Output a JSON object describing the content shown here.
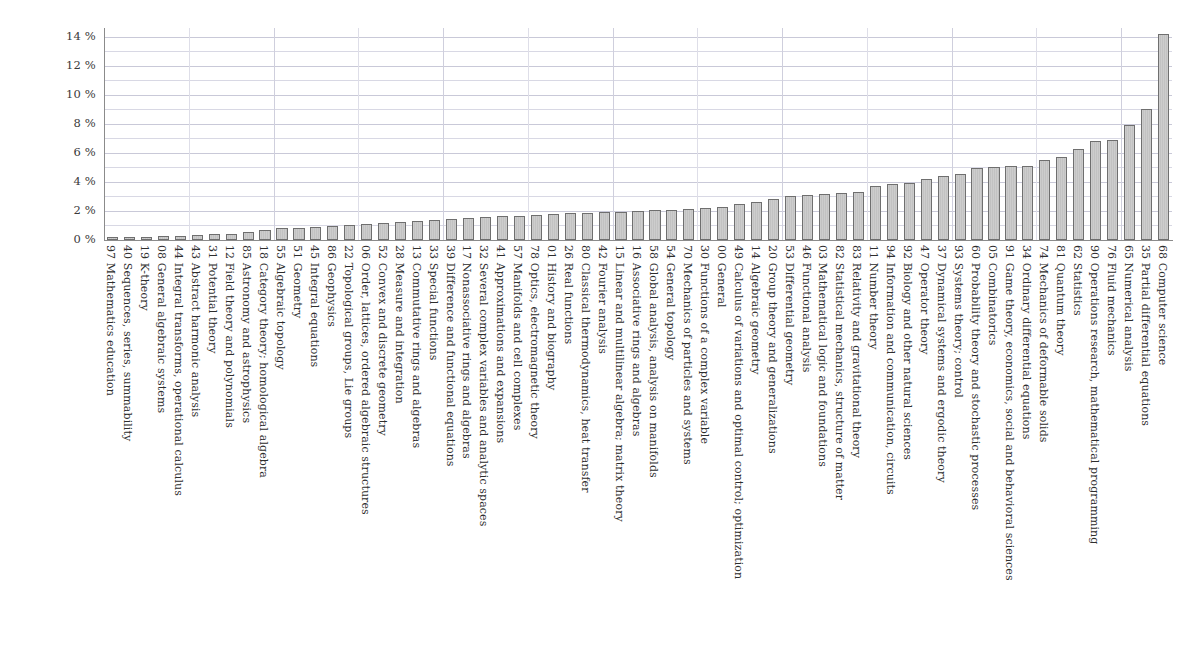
{
  "chart_data": {
    "type": "bar",
    "title": "",
    "subtitle": "",
    "xlabel": "",
    "ylabel": "",
    "ylim": [
      0,
      14.6
    ],
    "ytick_labels": [
      "0 %",
      "2 %",
      "4 %",
      "6 %",
      "8 %",
      "10 %",
      "12 %",
      "14 %"
    ],
    "ytick_values": [
      0,
      2,
      4,
      6,
      8,
      10,
      12,
      14
    ],
    "grid": true,
    "legend": "none",
    "value_unit": "%",
    "categories": [
      "97 Mathematics education",
      "40 Sequences, series, summability",
      "19 K-theory",
      "08 General algebraic systems",
      "44 Integral transforms, operational calculus",
      "43 Abstract harmonic analysis",
      "31 Potential theory",
      "12 Field theory and polynomials",
      "85 Astronomy and astrophysics",
      "18 Category theory; homological algebra",
      "55 Algebraic topology",
      "51 Geometry",
      "45 Integral equations",
      "86 Geophysics",
      "22 Topological groups, Lie groups",
      "06 Order, lattices, ordered algebraic structures",
      "52 Convex and discrete geometry",
      "28 Measure and integration",
      "13 Commutative rings and algebras",
      "33 Special functions",
      "39 Difference and functional equations",
      "17 Nonassociative rings and algebras",
      "32 Several complex variables and analytic spaces",
      "41 Approximations and expansions",
      "57 Manifolds and cell complexes",
      "78 Optics, electromagnetic theory",
      "01 History and biography",
      "26 Real functions",
      "80 Classical thermodynamics, heat transfer",
      "42 Fourier analysis",
      "15 Linear and multilinear algebra; matrix theory",
      "16 Associative rings and algebras",
      "58 Global analysis, analysis on manifolds",
      "54 General topology",
      "70 Mechanics of particles and systems",
      "30 Functions of a complex variable",
      "00 General",
      "49 Calculus of variations and optimal control; optimization",
      "14 Algebraic geometry",
      "20 Group theory and generalizations",
      "53 Differential geometry",
      "46 Functional analysis",
      "03 Mathematical logic and foundations",
      "82 Statistical mechanics, structure of matter",
      "83 Relativity and gravitational theory",
      "11 Number theory",
      "94 Information and communication, circuits",
      "92 Biology and other natural sciences",
      "47 Operator theory",
      "37 Dynamical systems and ergodic theory",
      "93 Systems theory; control",
      "60 Probability theory and stochastic processes",
      "05 Combinatorics",
      "91 Game theory, economics, social and behavioral sciences",
      "34 Ordinary differential equations",
      "74 Mechanics of deformable solids",
      "81 Quantum theory",
      "62 Statistics",
      "90 Operations research, mathematical programming",
      "76 Fluid mechanics",
      "65 Numerical analysis",
      "35 Partial differential equations",
      "68 Computer science"
    ],
    "values": [
      0.14,
      0.18,
      0.22,
      0.26,
      0.3,
      0.34,
      0.38,
      0.42,
      0.55,
      0.72,
      0.8,
      0.86,
      0.92,
      0.96,
      1.05,
      1.12,
      1.2,
      1.26,
      1.32,
      1.38,
      1.44,
      1.5,
      1.58,
      1.62,
      1.66,
      1.72,
      1.78,
      1.84,
      1.88,
      1.92,
      1.96,
      2.0,
      2.04,
      2.08,
      2.12,
      2.2,
      2.28,
      2.45,
      2.62,
      2.8,
      3.0,
      3.1,
      3.16,
      3.22,
      3.3,
      3.7,
      3.85,
      3.92,
      4.22,
      4.38,
      4.55,
      4.98,
      5.02,
      5.08,
      5.12,
      5.5,
      5.7,
      6.3,
      6.8,
      6.9,
      7.95,
      9.05,
      14.2
    ]
  },
  "axis": {
    "y_title": "",
    "x_title": ""
  }
}
